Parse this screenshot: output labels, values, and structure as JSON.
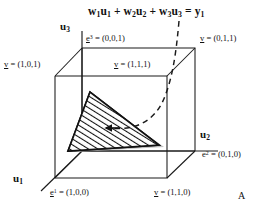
{
  "figure": {
    "panel_label": "A",
    "equation": "w1u1 + w2u2 + w3u3 = y1",
    "axes": {
      "x_axis": "u1",
      "y_axis": "u2",
      "z_axis": "u3"
    },
    "vertex_labels": {
      "e3": "e3 = (0,0,1)",
      "v011": "v = (0,1,1)",
      "v101": "v = (1,0,1)",
      "v111": "v = (1,1,1)",
      "e2": "e2 = (0,1,0)",
      "e1": "e1 = (1,0,0)",
      "v110": "v = (1,1,0)"
    },
    "colors": {
      "stroke": "#1a1a1a",
      "hatch": "#111111",
      "shade": "#b5b5b5",
      "background": "#ffffff"
    },
    "elements": {
      "hatched_triangle": "simplex-plane",
      "dashed_curve": "constraint-curve",
      "arrow_marker": "solution-arrow"
    }
  }
}
